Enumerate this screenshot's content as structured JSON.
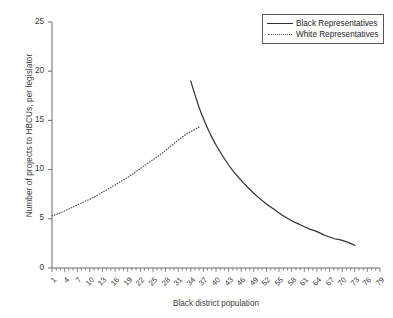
{
  "chart_data": {
    "type": "line",
    "title": "",
    "xlabel": "Black district population",
    "ylabel": "Number of projects to HBCUs, per legislator",
    "xlim": [
      1,
      79
    ],
    "ylim": [
      0,
      25
    ],
    "grid": false,
    "legend_position": "top-right",
    "y_ticks": [
      "0",
      "5",
      "10",
      "15",
      "20",
      "25"
    ],
    "y_tick_values": [
      0,
      5,
      10,
      15,
      20,
      25
    ],
    "x_ticks": [
      "1",
      "4",
      "7",
      "10",
      "13",
      "16",
      "19",
      "22",
      "25",
      "28",
      "31",
      "34",
      "37",
      "40",
      "43",
      "46",
      "49",
      "52",
      "55",
      "58",
      "61",
      "64",
      "67",
      "70",
      "73",
      "76",
      "79"
    ],
    "x_tick_values": [
      1,
      4,
      7,
      10,
      13,
      16,
      19,
      22,
      25,
      28,
      31,
      34,
      37,
      40,
      43,
      46,
      49,
      52,
      55,
      58,
      61,
      64,
      67,
      70,
      73,
      76,
      79
    ],
    "x_minor_tick_step": 1,
    "series": [
      {
        "name": "Black Representatives",
        "style": "solid",
        "color": "#333333",
        "x": [
          34,
          35,
          36,
          37,
          38,
          39,
          40,
          42,
          44,
          46,
          48,
          50,
          52,
          54,
          56,
          58,
          60,
          62,
          64,
          66,
          68,
          70,
          72,
          73
        ],
        "values": [
          19.0,
          17.6,
          16.3,
          15.2,
          14.2,
          13.3,
          12.5,
          11.1,
          9.9,
          8.9,
          8.0,
          7.2,
          6.5,
          5.9,
          5.3,
          4.8,
          4.4,
          4.0,
          3.7,
          3.3,
          3.0,
          2.8,
          2.5,
          2.3
        ]
      },
      {
        "name": "White Representatives",
        "style": "dotted",
        "color": "#555555",
        "x": [
          1,
          3,
          5,
          7,
          9,
          11,
          13,
          15,
          17,
          19,
          21,
          23,
          25,
          27,
          29,
          31,
          33,
          35,
          36
        ],
        "values": [
          5.3,
          5.6,
          6.0,
          6.4,
          6.8,
          7.2,
          7.7,
          8.2,
          8.7,
          9.2,
          9.8,
          10.4,
          11.0,
          11.6,
          12.3,
          13.0,
          13.6,
          14.1,
          14.3
        ]
      }
    ],
    "legend": [
      {
        "label": "Black Representatives",
        "style": "solid"
      },
      {
        "label": "White Representatives",
        "style": "dotted"
      }
    ]
  }
}
